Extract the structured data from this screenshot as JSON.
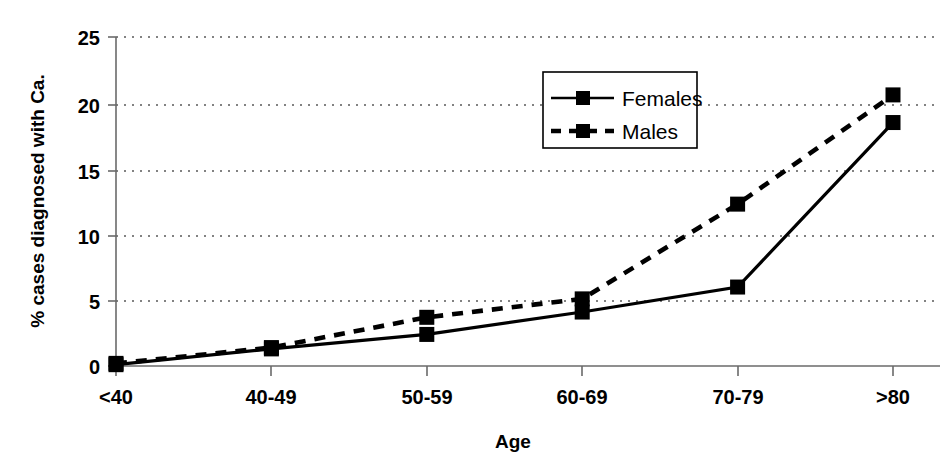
{
  "chart_data": {
    "type": "line",
    "title": "",
    "xlabel": "Age",
    "ylabel": "% cases diagnosed with Ca.",
    "categories": [
      "<40",
      "40-49",
      "50-59",
      "60-69",
      "70-79",
      ">80"
    ],
    "series": [
      {
        "name": "Females",
        "style": "solid",
        "marker": "square",
        "color": "#000000",
        "values": [
          0.1,
          1.3,
          2.4,
          4.1,
          6.0,
          18.5
        ]
      },
      {
        "name": "Males",
        "style": "dashed",
        "marker": "square",
        "color": "#000000",
        "values": [
          0.2,
          1.4,
          3.7,
          5.1,
          12.3,
          20.6
        ]
      }
    ],
    "ylim": [
      0,
      25
    ],
    "yticks": [
      0,
      5,
      10,
      15,
      20,
      25
    ],
    "ytick_labels": [
      "0",
      "5",
      "10",
      "15",
      "20",
      "25"
    ],
    "grid": "horizontal-dotted",
    "legend_position": "top-center-right",
    "background": "#ffffff"
  },
  "axes": {
    "y_title": "% cases diagnosed with Ca.",
    "x_title": "Age",
    "y_tick_0": "0",
    "y_tick_1": "5",
    "y_tick_2": "10",
    "y_tick_3": "15",
    "y_tick_4": "20",
    "y_tick_5": "25",
    "x_tick_0": "<40",
    "x_tick_1": "40-49",
    "x_tick_2": "50-59",
    "x_tick_3": "60-69",
    "x_tick_4": "70-79",
    "x_tick_5": ">80"
  },
  "legend": {
    "entry_0": "Females",
    "entry_1": "Males"
  }
}
